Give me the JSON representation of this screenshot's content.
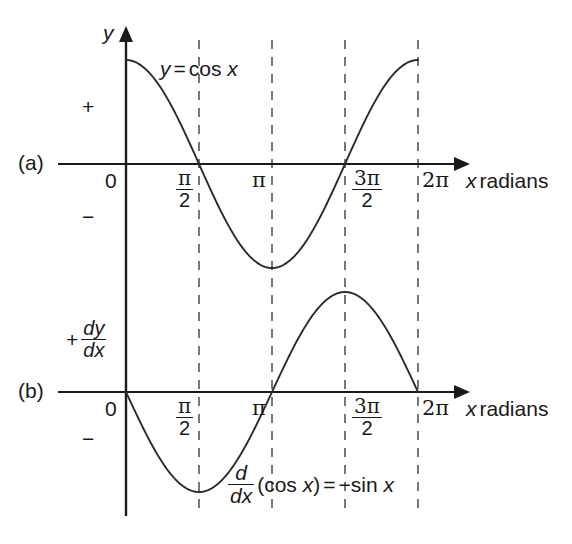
{
  "figure": {
    "panels": [
      {
        "tag": "(a)",
        "vertical_axis_label": "y",
        "curve_label_parts": {
          "lhs": "y",
          "eq": "=",
          "rhs": "cos x"
        },
        "curve_label_full": "y = cos x",
        "plus_sign": "+",
        "minus_sign": "−",
        "origin_label": "0",
        "x_axis_name": "x",
        "x_axis_unit": "radians"
      },
      {
        "tag": "(b)",
        "vertical_axis_label_sign": "+",
        "vertical_axis_fraction": {
          "num": "dy",
          "den": "dx"
        },
        "curve_label_full": "d/dx (cos x) = −sin x",
        "curve_label_parts": {
          "frac": {
            "num": "d",
            "den": "dx"
          },
          "argument": "(cos x)",
          "eq": "=",
          "rhs": "−sin x"
        },
        "plus_sign": "+",
        "minus_sign": "−",
        "origin_label": "0",
        "x_axis_name": "x",
        "x_axis_unit": "radians"
      }
    ],
    "x_ticks": [
      {
        "id": "zero",
        "label": "0",
        "kind": "plain",
        "x_value": 0
      },
      {
        "id": "half-pi",
        "label": "π/2",
        "kind": "fraction",
        "num": "π",
        "den": "2",
        "x_value": 1.5707963
      },
      {
        "id": "pi",
        "label": "π",
        "kind": "plain",
        "x_value": 3.1415927
      },
      {
        "id": "three-half-pi",
        "label": "3π/2",
        "kind": "fraction",
        "num": "3π",
        "den": "2",
        "x_value": 4.712389
      },
      {
        "id": "two-pi",
        "label": "2π",
        "kind": "plain",
        "x_value": 6.2831853
      }
    ],
    "colors": {
      "ink": "#1a1a1a",
      "curve": "#2b2b2b",
      "dashed_guide": "#555555",
      "background": "#ffffff"
    }
  },
  "chart_data": [
    {
      "type": "line",
      "id": "panel-a-cosine",
      "title": "y = cos x",
      "xlabel": "x radians",
      "ylabel": "y",
      "xlim": [
        0,
        6.2831853
      ],
      "ylim": [
        -1,
        1
      ],
      "grid": false,
      "gridlines_dashed_at_x": [
        1.5707963,
        3.1415927,
        4.712389,
        6.2831853
      ],
      "legend": "none",
      "annotations": [
        "y = cos x",
        "+",
        "−",
        "(a)"
      ],
      "xtick_labels": [
        "0",
        "π/2",
        "π",
        "3π/2",
        "2π"
      ],
      "xtick_values": [
        0,
        1.5707963,
        3.1415927,
        4.712389,
        6.2831853
      ],
      "series": [
        {
          "name": "cos x",
          "x": [
            0,
            0.3141593,
            0.6283185,
            0.9424778,
            1.2566371,
            1.5707963,
            1.8849556,
            2.1991149,
            2.5132741,
            2.8274334,
            3.1415927,
            3.4557519,
            3.7699112,
            4.0840704,
            4.3982297,
            4.712389,
            5.0265482,
            5.3407075,
            5.6548668,
            5.969026,
            6.2831853
          ],
          "values": [
            1.0,
            0.951,
            0.809,
            0.588,
            0.309,
            0.0,
            -0.309,
            -0.588,
            -0.809,
            -0.951,
            -1.0,
            -0.951,
            -0.809,
            -0.588,
            -0.309,
            0.0,
            0.309,
            0.588,
            0.809,
            0.951,
            1.0
          ]
        }
      ]
    },
    {
      "type": "line",
      "id": "panel-b-negative-sine",
      "title": "d/dx (cos x) = −sin x",
      "xlabel": "x radians",
      "ylabel": "dy/dx",
      "xlim": [
        0,
        6.2831853
      ],
      "ylim": [
        -1,
        1
      ],
      "grid": false,
      "gridlines_dashed_at_x": [
        1.5707963,
        3.1415927,
        4.712389,
        6.2831853
      ],
      "legend": "none",
      "annotations": [
        "d/dx (cos x) = −sin x",
        "+",
        "−",
        "(b)"
      ],
      "xtick_labels": [
        "0",
        "π/2",
        "π",
        "3π/2",
        "2π"
      ],
      "xtick_values": [
        0,
        1.5707963,
        3.1415927,
        4.712389,
        6.2831853
      ],
      "series": [
        {
          "name": "−sin x",
          "x": [
            0,
            0.3141593,
            0.6283185,
            0.9424778,
            1.2566371,
            1.5707963,
            1.8849556,
            2.1991149,
            2.5132741,
            2.8274334,
            3.1415927,
            3.4557519,
            3.7699112,
            4.0840704,
            4.3982297,
            4.712389,
            5.0265482,
            5.3407075,
            5.6548668,
            5.969026,
            6.2831853
          ],
          "values": [
            0.0,
            -0.309,
            -0.588,
            -0.809,
            -0.951,
            -1.0,
            -0.951,
            -0.809,
            -0.588,
            -0.309,
            0.0,
            0.309,
            0.588,
            0.809,
            0.951,
            1.0,
            0.951,
            0.809,
            0.588,
            0.309,
            0.0
          ]
        }
      ]
    }
  ],
  "geometry": {
    "x_origin_px": 126,
    "x_end_px": 418,
    "arrow_end_px": 466,
    "panel_a_axis_y_px": 164,
    "panel_b_axis_y_px": 392,
    "amplitude_a_px": 104,
    "amplitude_b_px": 100,
    "vline_top_px": 40,
    "vline_bottom_px": 516
  }
}
